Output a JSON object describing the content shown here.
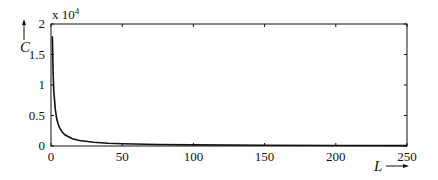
{
  "chart_data": {
    "type": "line",
    "title": "",
    "xlabel": "L",
    "ylabel": "C",
    "y_multiplier": "x 10",
    "y_multiplier_exp": "4",
    "xlim": [
      0,
      250
    ],
    "ylim": [
      0,
      2
    ],
    "x_ticks": [
      "0",
      "50",
      "100",
      "150",
      "200",
      "250"
    ],
    "y_ticks": [
      "0",
      "0.5",
      "1",
      "1.5",
      "2"
    ],
    "grid": false,
    "legend": null,
    "series": [
      {
        "name": "C",
        "x": [
          1,
          1.5,
          2,
          3,
          4,
          5,
          6,
          8,
          10,
          15,
          20,
          30,
          40,
          50,
          75,
          100,
          150,
          200,
          250
        ],
        "values": [
          1.8,
          1.2,
          0.9,
          0.6,
          0.45,
          0.36,
          0.3,
          0.225,
          0.18,
          0.12,
          0.09,
          0.06,
          0.045,
          0.036,
          0.024,
          0.018,
          0.012,
          0.009,
          0.0072
        ]
      }
    ]
  }
}
